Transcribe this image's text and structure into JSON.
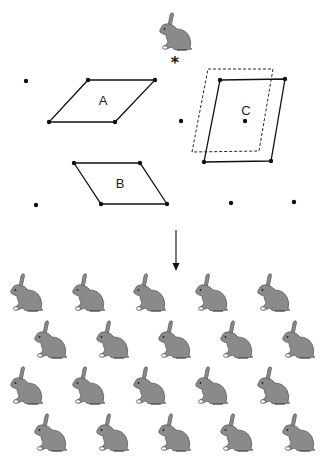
{
  "figure": {
    "colors": {
      "line": "#111111",
      "rabbit_fill": "#8a8a8a",
      "rabbit_outline": "#555555",
      "background": "#ffffff"
    },
    "motif": {
      "name": "rabbit",
      "x": 157,
      "y": 12,
      "w": 36,
      "h": 40
    },
    "origin_marker": {
      "symbol": "*",
      "x": 175,
      "y": 62
    },
    "unit_cells": [
      {
        "label": "A",
        "label_x": 103,
        "label_y": 105,
        "points": "88,80 155,80 115,122 49,122",
        "style": "solid"
      },
      {
        "label": "B",
        "label_x": 120,
        "label_y": 188,
        "points": "74,163 140,163 167,204 101,204",
        "style": "solid"
      },
      {
        "label": "C",
        "label_x": 246,
        "label_y": 115,
        "points": "220,80 285,79 271,161 204,162",
        "style": "solid"
      },
      {
        "label": "",
        "label_x": 0,
        "label_y": 0,
        "points": "208,69 273,69 259,151 192,152",
        "style": "dashed"
      }
    ],
    "lattice_points": [
      [
        26,
        81
      ],
      [
        88,
        80
      ],
      [
        155,
        80
      ],
      [
        49,
        122
      ],
      [
        115,
        122
      ],
      [
        181,
        121
      ],
      [
        220,
        80
      ],
      [
        285,
        79
      ],
      [
        204,
        162
      ],
      [
        271,
        161
      ],
      [
        245,
        121
      ],
      [
        74,
        163
      ],
      [
        140,
        163
      ],
      [
        101,
        204
      ],
      [
        167,
        204
      ],
      [
        36,
        205
      ],
      [
        231,
        203
      ],
      [
        294,
        202
      ]
    ],
    "arrow": {
      "x": 176,
      "y1": 230,
      "y2": 271
    },
    "pattern": {
      "rows": [
        {
          "y": 273,
          "xs": [
            8,
            70,
            131,
            193,
            255
          ]
        },
        {
          "y": 320,
          "xs": [
            32,
            94,
            156,
            218,
            280
          ]
        },
        {
          "y": 366,
          "xs": [
            8,
            70,
            131,
            193,
            255
          ]
        },
        {
          "y": 413,
          "xs": [
            32,
            94,
            156,
            218,
            280
          ]
        }
      ],
      "rabbit_w": 36,
      "rabbit_h": 40
    }
  }
}
